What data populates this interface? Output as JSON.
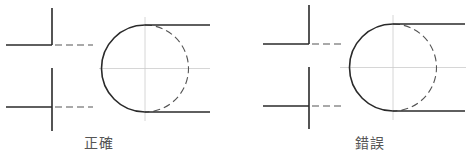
{
  "figures": [
    {
      "label": "正確",
      "meaning": "correct",
      "lines": {
        "top_vertical": {
          "x1": 52,
          "y1": 8,
          "x2": 52,
          "y2": 45
        },
        "top_horizontal": {
          "x1": 6,
          "y1": 45,
          "x2": 52,
          "y2": 45
        },
        "top_hidden": {
          "x1": 55,
          "y1": 45,
          "x2": 93,
          "y2": 45
        },
        "bottom_vertical": {
          "x1": 52,
          "y1": 68,
          "x2": 52,
          "y2": 131
        },
        "bottom_horizontal": {
          "x1": 6,
          "y1": 107,
          "x2": 52,
          "y2": 107
        },
        "bottom_hidden": {
          "x1": 55,
          "y1": 107,
          "x2": 93,
          "y2": 107
        }
      },
      "arc": {
        "cx": 145,
        "cy": 68.5,
        "r": 43.5,
        "line_end_x": 210
      },
      "centerlines": {
        "h": {
          "x1": 99,
          "x2": 210,
          "y": 68.5
        },
        "v": {
          "x": 145,
          "y1": 17,
          "y2": 121
        }
      },
      "label_pos": {
        "left": 84,
        "top": 132
      }
    },
    {
      "label": "錯誤",
      "meaning": "incorrect",
      "lines": {
        "top_vertical": {
          "x1": 309,
          "y1": 5,
          "x2": 309,
          "y2": 44
        },
        "top_horizontal": {
          "x1": 263,
          "y1": 44,
          "x2": 309,
          "y2": 44
        },
        "top_hidden": {
          "x1": 312,
          "y1": 44,
          "x2": 345,
          "y2": 44
        },
        "bottom_vertical": {
          "x1": 309,
          "y1": 67,
          "x2": 309,
          "y2": 129
        },
        "bottom_horizontal": {
          "x1": 263,
          "y1": 106,
          "x2": 309,
          "y2": 106
        },
        "bottom_hidden": {
          "x1": 312,
          "y1": 106,
          "x2": 345,
          "y2": 106
        }
      },
      "arc": {
        "cx": 393,
        "cy": 67.5,
        "r": 43.5,
        "line_end_x": 465
      },
      "centerlines": {
        "h": {
          "x1": 340,
          "x2": 466,
          "y": 67.5
        },
        "v": {
          "x": 393,
          "y1": 15,
          "y2": 120
        }
      },
      "label_pos": {
        "left": 355,
        "top": 132
      }
    }
  ],
  "colors": {
    "line": "#2a2a2a",
    "hidden": "#555555",
    "center": "#cccccc",
    "label": "#555555"
  }
}
